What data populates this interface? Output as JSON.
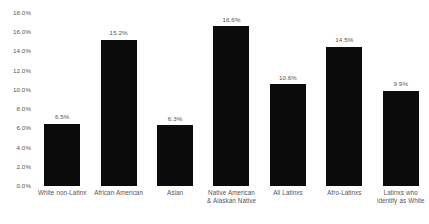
{
  "chart_data": {
    "type": "bar",
    "title": "",
    "xlabel": "",
    "ylabel": "",
    "ylim": [
      0,
      18
    ],
    "ytick_step": 2,
    "grid": false,
    "legend": null,
    "bar_color": "#0b0b0b",
    "background_color": "#ffffff",
    "text_color": "#555555",
    "yticks": [
      "18.0%",
      "16.0%",
      "14.0%",
      "12.0%",
      "10.0%",
      "8.0%",
      "6.0%",
      "4.0%",
      "2.0%",
      "0.0%"
    ],
    "ytick_values": [
      18,
      16,
      14,
      12,
      10,
      8,
      6,
      4,
      2,
      0
    ],
    "categories": [
      "White non-Latinx",
      "African American",
      "Asian",
      "Native American & Alaskan Native",
      "All Latinxs",
      "Afro-Latinxs",
      "Latinxs who identify as White"
    ],
    "category_lines": [
      [
        "White non-Latinx"
      ],
      [
        "African American"
      ],
      [
        "Asian"
      ],
      [
        "Native American",
        "& Alaskan Native"
      ],
      [
        "All Latinxs"
      ],
      [
        "Afro-Latinxs"
      ],
      [
        "Latinxs who",
        "identify as White"
      ]
    ],
    "values": [
      6.5,
      15.2,
      6.3,
      16.6,
      10.6,
      14.5,
      9.9
    ],
    "value_labels": [
      "6.5%",
      "15.2%",
      "6.3%",
      "16.6%",
      "10.6%",
      "14.5%",
      "9.9%"
    ]
  }
}
